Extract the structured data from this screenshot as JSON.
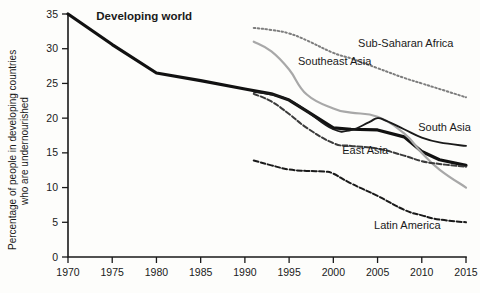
{
  "chart_data": {
    "type": "line",
    "title": "",
    "xlabel": "",
    "ylabel": "Percentage of people in developing countries who are undernourished",
    "ylabel_line1": "Percentage of people in developing countries",
    "ylabel_line2": "who are undernourished",
    "xlim": [
      1970,
      2015
    ],
    "ylim": [
      0,
      35
    ],
    "grid": false,
    "legend_position": "inline-labels",
    "xticks": [
      "1970",
      "1975",
      "1980",
      "1985",
      "1990",
      "1995",
      "2000",
      "2005",
      "2010",
      "2015"
    ],
    "yticks": [
      "0",
      "5",
      "10",
      "15",
      "20",
      "25",
      "30",
      "35"
    ],
    "series": [
      {
        "name": "Developing world",
        "style": "solid-thick",
        "color": "#111111",
        "label_x": 1973.2,
        "label_y": 34.2,
        "label_bold": true,
        "x": [
          1970,
          1975,
          1980,
          1985,
          1990,
          1993,
          1995,
          1997,
          2000,
          2002,
          2005,
          2008,
          2010,
          2012,
          2015
        ],
        "y": [
          35.0,
          30.6,
          26.5,
          25.4,
          24.2,
          23.5,
          22.6,
          21.0,
          18.6,
          18.4,
          18.3,
          17.3,
          15.2,
          14.0,
          13.2
        ]
      },
      {
        "name": "Sub-Saharan Africa",
        "style": "dotted",
        "color": "#7d7d7d",
        "label_x": 2002.8,
        "label_y": 30.2,
        "label_bold": false,
        "x": [
          1991,
          1993,
          1995,
          1997,
          2000,
          2002,
          2005,
          2008,
          2010,
          2012,
          2015
        ],
        "y": [
          33.0,
          32.7,
          32.2,
          31.2,
          29.4,
          28.6,
          27.2,
          25.8,
          25.0,
          24.2,
          23.0
        ]
      },
      {
        "name": "Southeast Asia",
        "style": "solid-light",
        "color": "#a8a8a8",
        "label_x": 1996.0,
        "label_y": 27.6,
        "label_bold": false,
        "x": [
          1991,
          1993,
          1995,
          1997,
          2000,
          2002,
          2005,
          2008,
          2010,
          2012,
          2015
        ],
        "y": [
          31.0,
          29.6,
          27.0,
          23.4,
          21.4,
          20.8,
          20.2,
          17.8,
          15.0,
          12.6,
          10.0
        ]
      },
      {
        "name": "South Asia",
        "style": "solid-thin",
        "color": "#1a1a1a",
        "label_x": 2009.6,
        "label_y": 18.2,
        "label_bold": false,
        "x": [
          1991,
          1993,
          1995,
          1997,
          2000,
          2002,
          2004,
          2005,
          2006,
          2008,
          2010,
          2012,
          2015
        ],
        "y": [
          23.8,
          23.4,
          22.6,
          21.0,
          18.4,
          18.3,
          19.4,
          20.0,
          19.6,
          18.4,
          17.2,
          16.5,
          16.0
        ]
      },
      {
        "name": "East Asia",
        "style": "dashed",
        "color": "#3b3b3b",
        "label_x": 2001.0,
        "label_y": 14.8,
        "label_bold": false,
        "x": [
          1991,
          1993,
          1995,
          1997,
          2000,
          2002,
          2005,
          2008,
          2010,
          2012,
          2015
        ],
        "y": [
          23.5,
          22.4,
          20.6,
          18.6,
          16.4,
          16.0,
          15.6,
          14.6,
          13.8,
          13.4,
          13.0
        ]
      },
      {
        "name": "Latin America",
        "style": "dashed",
        "color": "#1a1a1a",
        "label_x": 2004.6,
        "label_y": 4.0,
        "label_bold": false,
        "x": [
          1991,
          1993,
          1995,
          1997,
          1999,
          2000,
          2002,
          2005,
          2008,
          2010,
          2012,
          2015
        ],
        "y": [
          13.9,
          13.2,
          12.6,
          12.4,
          12.3,
          12.0,
          10.6,
          8.8,
          6.8,
          6.0,
          5.4,
          5.0
        ]
      }
    ]
  }
}
